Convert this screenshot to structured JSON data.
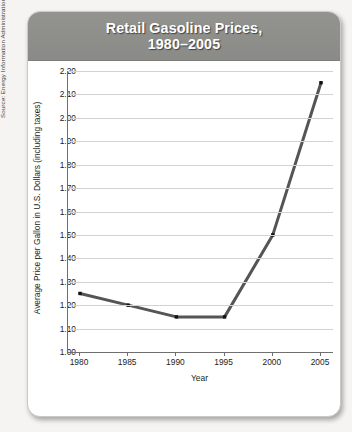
{
  "card": {
    "title_line1": "Retail Gasoline Prices,",
    "title_line2": "1980–2005",
    "header_color": "#8c8c88"
  },
  "source_note": "Source: Energy Information Administration, Monthly Energy Review",
  "chart_data": {
    "type": "line",
    "title": "Retail Gasoline Prices, 1980–2005",
    "xlabel": "Year",
    "ylabel": "Average Price per Gallon in U.S. Dollars (including taxes)",
    "x": [
      1980,
      1985,
      1990,
      1995,
      2000,
      2005
    ],
    "values": [
      1.25,
      1.2,
      1.15,
      1.15,
      1.5,
      2.15
    ],
    "xtick_labels": [
      "1980",
      "1985",
      "1990",
      "1995",
      "2000",
      "2005"
    ],
    "ytick_labels": [
      "1.00",
      "1.10",
      "1.20",
      "1.30",
      "1.40",
      "1.50",
      "1.60",
      "1.70",
      "1.80",
      "1.90",
      "2.00",
      "2.10",
      "2.20"
    ],
    "ytick_values": [
      1.0,
      1.1,
      1.2,
      1.3,
      1.4,
      1.5,
      1.6,
      1.7,
      1.8,
      1.9,
      2.0,
      2.1,
      2.2
    ],
    "xlim": [
      1980,
      2005
    ],
    "ylim": [
      1.0,
      2.2
    ],
    "grid": true,
    "legend": "none",
    "line_color": "#555555",
    "marker_color": "#111111"
  }
}
